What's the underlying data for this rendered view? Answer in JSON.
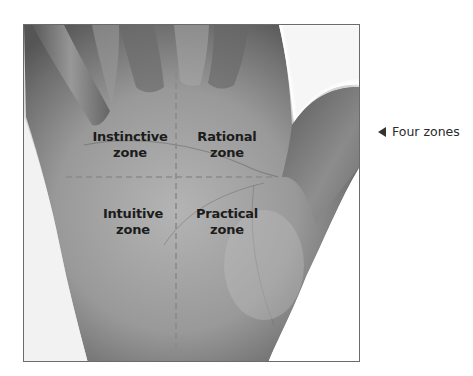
{
  "figure": {
    "caption": "Four zones",
    "caption_icon": "left-pointer-triangle-icon",
    "zones": [
      {
        "line1": "Instinctive",
        "line2": "zone"
      },
      {
        "line1": "Rational",
        "line2": "zone"
      },
      {
        "line1": "Intuitive",
        "line2": "zone"
      },
      {
        "line1": "Practical",
        "line2": "zone"
      }
    ],
    "colors": {
      "frame_border": "#6b6b6b",
      "dash_line": "#8a8a8a",
      "skin_dark": "#5e5e5e",
      "skin_mid": "#9a9a9a",
      "label_text": "#1c1c1c"
    }
  }
}
